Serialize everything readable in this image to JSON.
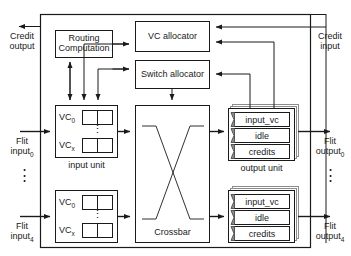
{
  "diagram": {
    "type": "block-diagram",
    "colors": {
      "line": "#1a1a1a",
      "text": "#1a1a1a",
      "background": "#ffffff",
      "shadow": "#9a9a9a"
    },
    "blocks": {
      "routing_computation": "Routing\nComputation",
      "routing_computation_line1": "Routing",
      "routing_computation_line2": "Computation",
      "vc_allocator": "VC allocator",
      "switch_allocator": "Switch allocator",
      "crossbar": "Crossbar"
    },
    "input_units": [
      {
        "caption": "input unit",
        "vc_first": "VC",
        "vc_first_sub": "0",
        "vc_last": "VC",
        "vc_last_sub": "x",
        "ellipsis": "⋮"
      },
      {
        "caption": "",
        "vc_first": "VC",
        "vc_first_sub": "0",
        "vc_last": "VC",
        "vc_last_sub": "x",
        "ellipsis": "⋮"
      }
    ],
    "output_units": [
      {
        "caption": "output unit",
        "rows": [
          "input_vc",
          "idle",
          "credits"
        ]
      },
      {
        "caption": "",
        "rows": [
          "input_vc",
          "idle",
          "credits"
        ]
      }
    ],
    "ports": {
      "credit_output_line1": "Credit",
      "credit_output_line2": "output",
      "credit_input_line1": "Credit",
      "credit_input_line2": "input",
      "flit_input_0_line1": "Flit",
      "flit_input_0_line2": "input",
      "flit_input_0_sub": "0",
      "flit_input_4_line1": "Flit",
      "flit_input_4_line2": "input",
      "flit_input_4_sub": "4",
      "flit_output_0_line1": "Flit",
      "flit_output_0_line2": "output",
      "flit_output_0_sub": "0",
      "flit_output_4_line1": "Flit",
      "flit_output_4_line2": "output",
      "flit_output_4_sub": "4",
      "vertical_ellipsis_left": "⋮",
      "vertical_ellipsis_right": "⋮"
    }
  }
}
